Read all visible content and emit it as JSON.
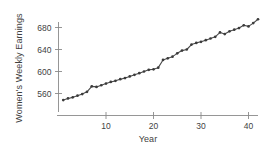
{
  "chart_data": {
    "type": "line",
    "title": "",
    "subtitle": "",
    "xlabel": "Year",
    "ylabel": "Women's Weekly Earnings",
    "grid": false,
    "legend": null,
    "marker": "filled-circle",
    "xlim": [
      0,
      43
    ],
    "ylim": [
      540,
      700
    ],
    "xticks": [
      10,
      20,
      30,
      40
    ],
    "xtick_labels": [
      "10",
      "20",
      "30",
      "40"
    ],
    "yticks": [
      560,
      600,
      640,
      680
    ],
    "ytick_labels": [
      "560",
      "600",
      "640",
      "680"
    ],
    "x": [
      1,
      2,
      3,
      4,
      5,
      6,
      7,
      8,
      9,
      10,
      11,
      12,
      13,
      14,
      15,
      16,
      17,
      18,
      19,
      20,
      21,
      22,
      23,
      24,
      25,
      26,
      27,
      28,
      29,
      30,
      31,
      32,
      33,
      34,
      35,
      36,
      37,
      38,
      39,
      40,
      41,
      42
    ],
    "values": [
      548,
      551,
      553,
      556,
      559,
      563,
      573,
      572,
      575,
      578,
      581,
      583,
      586,
      588,
      591,
      594,
      597,
      600,
      603,
      604,
      607,
      621,
      624,
      627,
      633,
      638,
      640,
      649,
      652,
      654,
      657,
      660,
      663,
      671,
      668,
      673,
      676,
      679,
      684,
      682,
      688,
      695
    ],
    "series": [
      {
        "name": "Women's Weekly Earnings",
        "color": "#3b3b3b",
        "values": [
          548,
          551,
          553,
          556,
          559,
          563,
          573,
          572,
          575,
          578,
          581,
          583,
          586,
          588,
          591,
          594,
          597,
          600,
          603,
          604,
          607,
          621,
          624,
          627,
          633,
          638,
          640,
          649,
          652,
          654,
          657,
          660,
          663,
          671,
          668,
          673,
          676,
          679,
          684,
          682,
          688,
          695
        ]
      }
    ]
  },
  "figure": {
    "axis_color": "#8a8a8a",
    "series_color": "#3b3b3b",
    "background": "#ffffff"
  }
}
